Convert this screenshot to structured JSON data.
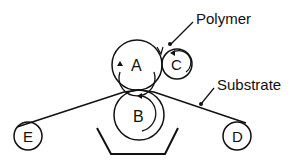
{
  "diagram": {
    "type": "roll-coating-schematic",
    "rollers": [
      {
        "id": "A",
        "label": "A",
        "cx": 137,
        "cy": 65,
        "r": 25
      },
      {
        "id": "B",
        "label": "B",
        "cx": 139,
        "cy": 115,
        "r": 25
      },
      {
        "id": "C",
        "label": "C",
        "cx": 177,
        "cy": 64,
        "r": 15
      },
      {
        "id": "D",
        "label": "D",
        "cx": 237,
        "cy": 136,
        "r": 14
      },
      {
        "id": "E",
        "label": "E",
        "cx": 28,
        "cy": 136,
        "r": 14
      }
    ],
    "labels": {
      "polymer": "Polymer",
      "substrate": "Substrate"
    },
    "colors": {
      "stroke": "#111111",
      "background": "#ffffff"
    }
  }
}
